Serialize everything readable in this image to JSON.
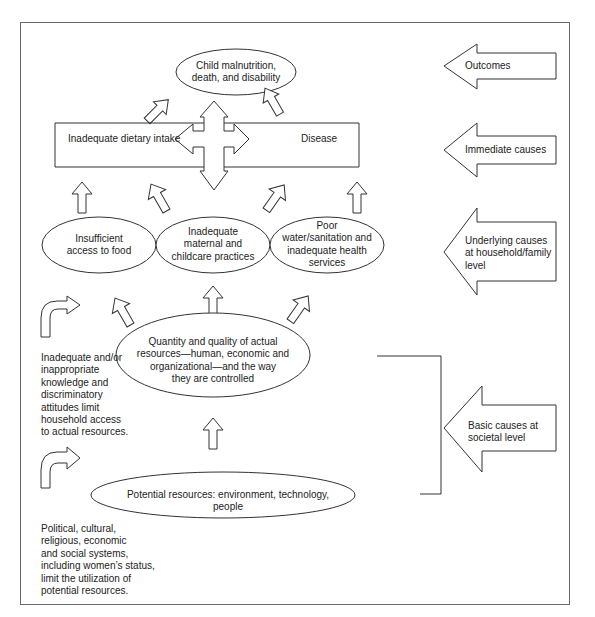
{
  "diagram": {
    "type": "conceptual framework (causes of child malnutrition)",
    "outcome": {
      "line1": "Child malnutrition,",
      "line2": "death, and disability"
    },
    "immediate": {
      "left": "Inadequate dietary intake",
      "right": "Disease"
    },
    "underlying": [
      {
        "lines": [
          "Insufficient",
          "access to food"
        ]
      },
      {
        "lines": [
          "Inadequate",
          "maternal and",
          "childcare practices"
        ]
      },
      {
        "lines": [
          "Poor",
          "water/sanitation  and",
          "inadequate health",
          "services"
        ]
      }
    ],
    "actual_resources": {
      "lines": [
        "Quantity and quality of actual",
        "resources—human, economic  and",
        "organizational—and the way",
        "they are controlled"
      ]
    },
    "potential_resources": {
      "text": "Potential resources: environment, technology, people"
    },
    "side_notes": [
      {
        "lines": [
          "Inadequate and/or",
          "inappropriate",
          "knowledge and",
          "discriminatory",
          "attitudes limit",
          "household access",
          "to actual resources."
        ]
      },
      {
        "lines": [
          "Political, cultural,",
          "religious, economic",
          "and social systems,",
          "including women’s status,",
          "limit the utilization of",
          "potential resources."
        ]
      }
    ],
    "levels": [
      {
        "lines": [
          "Outcomes"
        ]
      },
      {
        "lines": [
          "Immediate causes"
        ]
      },
      {
        "lines": [
          "Underlying causes",
          "at household/family",
          "level"
        ]
      },
      {
        "lines": [
          "Basic causes at",
          "societal level"
        ]
      }
    ]
  }
}
